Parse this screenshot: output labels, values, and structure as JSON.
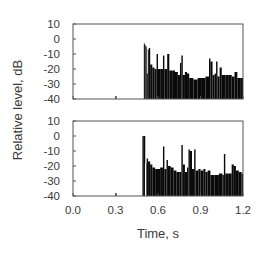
{
  "chart_data": [
    {
      "type": "bar",
      "title": "",
      "panel": "top",
      "xlabel": "Time, s",
      "ylabel": "Relative level, dB",
      "xlim": [
        0.0,
        1.2
      ],
      "ylim": [
        -40,
        10
      ],
      "xticks": [
        "0.0",
        "0.3",
        "0.6",
        "0.9",
        "1.2"
      ],
      "yticks": [
        "10",
        "0",
        "-10",
        "-20",
        "-30",
        "-40"
      ],
      "grid": false,
      "events": [
        {
          "t": 0.3,
          "db": -38
        },
        {
          "t": 0.5,
          "db": -3
        },
        {
          "t": 0.505,
          "db": -4
        },
        {
          "t": 0.512,
          "db": -5
        },
        {
          "t": 0.52,
          "db": -23
        },
        {
          "t": 0.528,
          "db": -7
        },
        {
          "t": 0.535,
          "db": -6
        },
        {
          "t": 0.545,
          "db": -17
        },
        {
          "t": 0.56,
          "db": -19
        },
        {
          "t": 0.575,
          "db": -20
        },
        {
          "t": 0.59,
          "db": -10
        },
        {
          "t": 0.6,
          "db": -20
        },
        {
          "t": 0.62,
          "db": -20
        },
        {
          "t": 0.635,
          "db": -11
        },
        {
          "t": 0.645,
          "db": -20
        },
        {
          "t": 0.665,
          "db": -10
        },
        {
          "t": 0.68,
          "db": -21
        },
        {
          "t": 0.7,
          "db": -21
        },
        {
          "t": 0.72,
          "db": -22
        },
        {
          "t": 0.74,
          "db": -24
        },
        {
          "t": 0.755,
          "db": -16
        },
        {
          "t": 0.765,
          "db": -11
        },
        {
          "t": 0.775,
          "db": -24
        },
        {
          "t": 0.79,
          "db": -22
        },
        {
          "t": 0.805,
          "db": -23
        },
        {
          "t": 0.82,
          "db": -26
        },
        {
          "t": 0.85,
          "db": -27
        },
        {
          "t": 0.88,
          "db": -26
        },
        {
          "t": 0.91,
          "db": -26
        },
        {
          "t": 0.935,
          "db": -25
        },
        {
          "t": 0.96,
          "db": -13
        },
        {
          "t": 0.97,
          "db": -15
        },
        {
          "t": 0.985,
          "db": -24
        },
        {
          "t": 1.0,
          "db": -23
        },
        {
          "t": 1.01,
          "db": -15
        },
        {
          "t": 1.02,
          "db": -25
        },
        {
          "t": 1.035,
          "db": -19
        },
        {
          "t": 1.05,
          "db": -24
        },
        {
          "t": 1.075,
          "db": -24
        },
        {
          "t": 1.1,
          "db": -24
        },
        {
          "t": 1.12,
          "db": -25
        },
        {
          "t": 1.14,
          "db": -22
        },
        {
          "t": 1.16,
          "db": -26
        },
        {
          "t": 1.185,
          "db": -26
        }
      ]
    },
    {
      "type": "bar",
      "title": "",
      "panel": "bottom",
      "xlabel": "Time, s",
      "ylabel": "Relative level, dB",
      "xlim": [
        0.0,
        1.2
      ],
      "ylim": [
        -40,
        10
      ],
      "xticks": [
        "0.0",
        "0.3",
        "0.6",
        "0.9",
        "1.2"
      ],
      "yticks": [
        "10",
        "0",
        "-10",
        "-20",
        "-30",
        "-40"
      ],
      "grid": false,
      "events": [
        {
          "t": 0.3,
          "db": -38
        },
        {
          "t": 0.49,
          "db": 0
        },
        {
          "t": 0.5,
          "db": 0
        },
        {
          "t": 0.51,
          "db": -18
        },
        {
          "t": 0.52,
          "db": -15
        },
        {
          "t": 0.53,
          "db": -17
        },
        {
          "t": 0.545,
          "db": -19
        },
        {
          "t": 0.56,
          "db": -21
        },
        {
          "t": 0.58,
          "db": -22
        },
        {
          "t": 0.6,
          "db": -22
        },
        {
          "t": 0.615,
          "db": -21
        },
        {
          "t": 0.635,
          "db": -7
        },
        {
          "t": 0.645,
          "db": -22
        },
        {
          "t": 0.66,
          "db": -16
        },
        {
          "t": 0.67,
          "db": -20
        },
        {
          "t": 0.69,
          "db": -21
        },
        {
          "t": 0.71,
          "db": -23
        },
        {
          "t": 0.73,
          "db": -24
        },
        {
          "t": 0.75,
          "db": -24
        },
        {
          "t": 0.765,
          "db": -6
        },
        {
          "t": 0.775,
          "db": -19
        },
        {
          "t": 0.79,
          "db": -24
        },
        {
          "t": 0.805,
          "db": -21
        },
        {
          "t": 0.815,
          "db": -9
        },
        {
          "t": 0.825,
          "db": -10
        },
        {
          "t": 0.84,
          "db": -22
        },
        {
          "t": 0.855,
          "db": -9
        },
        {
          "t": 0.865,
          "db": -23
        },
        {
          "t": 0.885,
          "db": -22
        },
        {
          "t": 0.9,
          "db": -23
        },
        {
          "t": 0.92,
          "db": -22
        },
        {
          "t": 0.935,
          "db": -24
        },
        {
          "t": 0.95,
          "db": -23
        },
        {
          "t": 0.97,
          "db": -26
        },
        {
          "t": 1.0,
          "db": -26
        },
        {
          "t": 1.03,
          "db": -25
        },
        {
          "t": 1.055,
          "db": -26
        },
        {
          "t": 1.065,
          "db": -12
        },
        {
          "t": 1.075,
          "db": -25
        },
        {
          "t": 1.1,
          "db": -25
        },
        {
          "t": 1.12,
          "db": -19
        },
        {
          "t": 1.135,
          "db": -20
        },
        {
          "t": 1.15,
          "db": -23
        },
        {
          "t": 1.17,
          "db": -24
        },
        {
          "t": 1.19,
          "db": -25
        }
      ]
    }
  ],
  "labels": {
    "xlabel": "Time, s",
    "ylabel": "Relative level, dB"
  },
  "style": {
    "bar_color": "#0a0a0a",
    "frame_color": "#555555",
    "text_color": "#3a3a3a"
  }
}
